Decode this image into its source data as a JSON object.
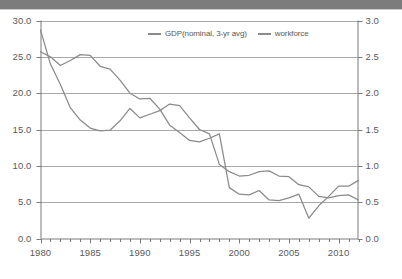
{
  "banner": {
    "name": "top-banner-strip",
    "color": "#7c7c7c"
  },
  "chart_data": {
    "type": "line",
    "title": "",
    "subtitle": "",
    "xlabel": "",
    "ylabel": "",
    "grid": true,
    "legend_position": "top-center",
    "x": [
      1980,
      1981,
      1982,
      1983,
      1984,
      1985,
      1986,
      1987,
      1988,
      1989,
      1990,
      1991,
      1992,
      1993,
      1994,
      1995,
      1996,
      1997,
      1998,
      1999,
      2000,
      2001,
      2002,
      2003,
      2004,
      2005,
      2006,
      2007,
      2008,
      2009,
      2010,
      2011,
      2012
    ],
    "xlim": [
      1980,
      2012
    ],
    "xticks": [
      1980,
      1985,
      1990,
      1995,
      2000,
      2005,
      2010
    ],
    "xticklabels": [
      "1980",
      "1985",
      "1990",
      "1995",
      "2000",
      "2005",
      "2010"
    ],
    "x_minor_ticks_every": 1,
    "axes": [
      {
        "id": "left",
        "name": "left-value-axis",
        "lim": [
          0.0,
          30.0
        ],
        "ticks": [
          0.0,
          5.0,
          10.0,
          15.0,
          20.0,
          25.0,
          30.0
        ],
        "ticklabels": [
          "0.0",
          "5.0",
          "10.0",
          "15.0",
          "20.0",
          "25.0",
          "30.0"
        ]
      },
      {
        "id": "right",
        "name": "right-value-axis",
        "lim": [
          0.0,
          3.0
        ],
        "ticks": [
          0.0,
          0.5,
          1.0,
          1.5,
          2.0,
          2.5,
          3.0
        ],
        "ticklabels": [
          "0.0",
          "0.5",
          "1.0",
          "1.5",
          "2.0",
          "2.5",
          "3.0"
        ]
      }
    ],
    "series": [
      {
        "name": "GDP(nominal, 3-yr avg)",
        "axis": "left",
        "color": "#8a8a8a",
        "values": [
          28.7,
          24.0,
          21.2,
          18.0,
          16.3,
          15.2,
          14.8,
          14.9,
          16.2,
          17.9,
          16.6,
          17.1,
          17.6,
          18.5,
          18.3,
          16.6,
          15.0,
          14.4,
          10.2,
          9.2,
          8.6,
          8.7,
          9.2,
          9.3,
          8.6,
          8.5,
          7.4,
          7.1,
          5.8,
          5.6,
          5.9,
          6.0,
          5.3
        ]
      },
      {
        "name": "workforce",
        "axis": "right",
        "color": "#8a8a8a",
        "values": [
          2.57,
          2.5,
          2.38,
          2.45,
          2.53,
          2.52,
          2.37,
          2.33,
          2.18,
          2.0,
          1.92,
          1.93,
          1.78,
          1.56,
          1.46,
          1.35,
          1.33,
          1.38,
          1.44,
          0.7,
          0.61,
          0.6,
          0.66,
          0.53,
          0.52,
          0.56,
          0.61,
          0.28,
          0.45,
          0.58,
          0.72,
          0.72,
          0.8
        ]
      }
    ],
    "annotations": []
  },
  "legend": {
    "entries": [
      {
        "label": "GDP(nominal, 3-yr avg)",
        "color": "#8a8a8a"
      },
      {
        "label": "workforce",
        "color": "#8a8a8a"
      }
    ]
  }
}
